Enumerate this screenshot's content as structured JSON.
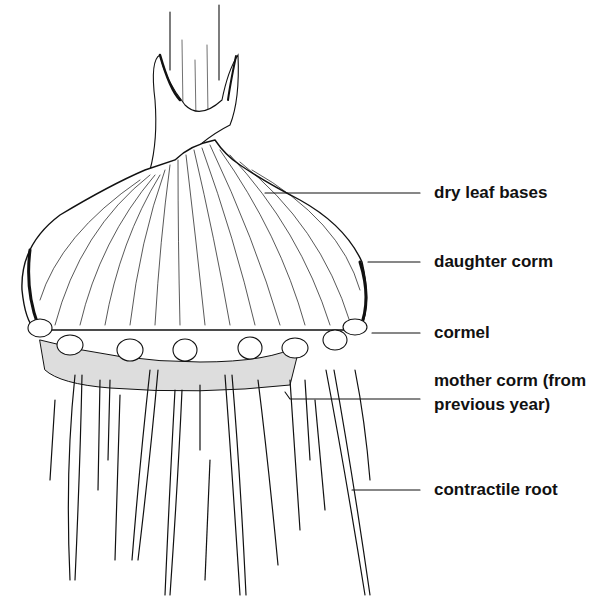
{
  "diagram": {
    "subject": "corm",
    "labels": [
      {
        "id": "dry-leaf-bases",
        "text": "dry leaf bases"
      },
      {
        "id": "daughter-corm",
        "text": "daughter corm"
      },
      {
        "id": "cormel",
        "text": "cormel"
      },
      {
        "id": "mother-corm",
        "text": "mother corm (from",
        "text2": "previous year)"
      },
      {
        "id": "contractile-root",
        "text": "contractile root"
      }
    ]
  }
}
